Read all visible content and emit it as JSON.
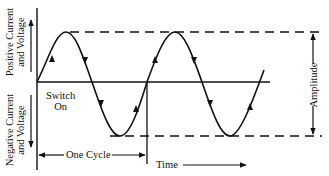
{
  "diagram": {
    "labels": {
      "positive_line1": "Positive Current",
      "positive_line2": "and Voltage",
      "negative_line1": "Negative Current",
      "negative_line2": "and Voltage",
      "switch_on_line1": "Switch",
      "switch_on_line2": "On",
      "one_cycle": "One Cycle",
      "time": "Time",
      "amplitude": "Amplitude"
    },
    "colors": {
      "ink": "#111111",
      "background": "#ffffff"
    }
  }
}
